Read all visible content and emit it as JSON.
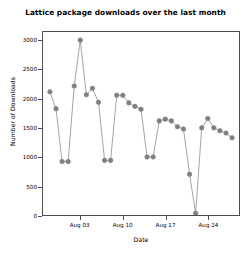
{
  "chart_data": {
    "type": "line",
    "title": "Lattice package downloads over the last month",
    "xlabel": "Date",
    "ylabel": "Number of Downloads",
    "grid": false,
    "legend": null,
    "marker": "filled-circle",
    "series_color": "#808080",
    "line_color": "#8c8c8c",
    "ylim": [
      0,
      3150
    ],
    "yticks": [
      0,
      500,
      1000,
      1500,
      2000,
      2500,
      3000
    ],
    "ytick_labels": [
      "0",
      "500",
      "1000",
      "1500",
      "2000",
      "2500",
      "3000"
    ],
    "xticks": [
      "Aug 03",
      "Aug 10",
      "Aug 17",
      "Aug 24"
    ],
    "xtick_indices": [
      5,
      12,
      19,
      26
    ],
    "x": [
      "Jul 29",
      "Jul 30",
      "Jul 31",
      "Aug 01",
      "Aug 02",
      "Aug 03",
      "Aug 04",
      "Aug 05",
      "Aug 06",
      "Aug 07",
      "Aug 08",
      "Aug 09",
      "Aug 10",
      "Aug 11",
      "Aug 12",
      "Aug 13",
      "Aug 14",
      "Aug 15",
      "Aug 16",
      "Aug 17",
      "Aug 18",
      "Aug 19",
      "Aug 20",
      "Aug 21",
      "Aug 22",
      "Aug 23",
      "Aug 24",
      "Aug 25",
      "Aug 26",
      "Aug 27",
      "Aug 28"
    ],
    "values": [
      2120,
      1830,
      920,
      920,
      2220,
      3010,
      2070,
      2180,
      1940,
      940,
      940,
      2060,
      2060,
      1930,
      1870,
      1820,
      1000,
      1000,
      1620,
      1650,
      1620,
      1520,
      1480,
      700,
      30,
      1500,
      1660,
      1500,
      1450,
      1410,
      1330
    ]
  }
}
